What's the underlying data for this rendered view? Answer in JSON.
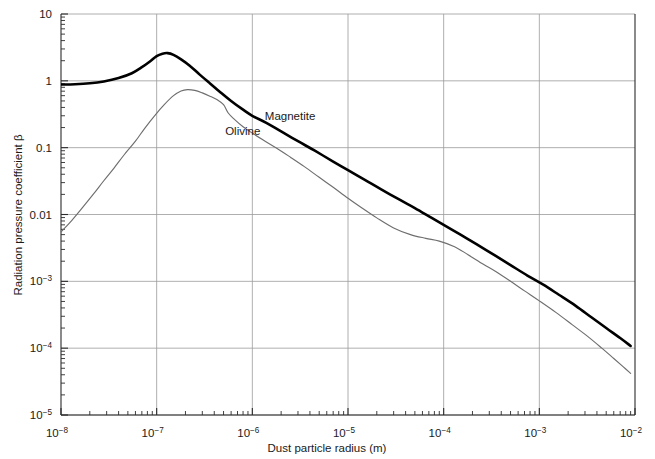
{
  "chart_data": {
    "type": "line",
    "title": "",
    "xlabel": "Dust particle radius (m)",
    "ylabel": "Radiation pressure coefficient β",
    "xscale": "log",
    "yscale": "log",
    "xlim": [
      1e-08,
      0.01
    ],
    "ylim": [
      1e-05,
      10
    ],
    "grid": true,
    "legend_position": "inline-annotation",
    "x_ticks": [
      {
        "value": 1e-08,
        "label": "10",
        "exponent": "−8"
      },
      {
        "value": 1e-07,
        "label": "10",
        "exponent": "−7"
      },
      {
        "value": 1e-06,
        "label": "10",
        "exponent": "−6"
      },
      {
        "value": 1e-05,
        "label": "10",
        "exponent": "−5"
      },
      {
        "value": 0.0001,
        "label": "10",
        "exponent": "−4"
      },
      {
        "value": 0.001,
        "label": "10",
        "exponent": "−3"
      },
      {
        "value": 0.01,
        "label": "10",
        "exponent": "−2"
      }
    ],
    "y_ticks": [
      {
        "value": 10,
        "label": "10",
        "exponent": ""
      },
      {
        "value": 1,
        "label": "1",
        "exponent": ""
      },
      {
        "value": 0.1,
        "label": "0.1",
        "exponent": ""
      },
      {
        "value": 0.01,
        "label": "0.01",
        "exponent": ""
      },
      {
        "value": 0.001,
        "label": "10",
        "exponent": "−3"
      },
      {
        "value": 0.0001,
        "label": "10",
        "exponent": "−4"
      },
      {
        "value": 1e-05,
        "label": "10",
        "exponent": "−5"
      }
    ],
    "annotations": [
      {
        "text": "Magnetite",
        "x": 1.35e-06,
        "y": 0.26
      },
      {
        "text": "Olivine",
        "x": 5.2e-07,
        "y": 0.155
      }
    ],
    "series": [
      {
        "name": "Magnetite",
        "color": "#000000",
        "linewidth": 2.6,
        "points": [
          [
            1e-08,
            0.88
          ],
          [
            1.4e-08,
            0.89
          ],
          [
            2e-08,
            0.92
          ],
          [
            2.8e-08,
            0.98
          ],
          [
            4e-08,
            1.1
          ],
          [
            5.5e-08,
            1.3
          ],
          [
            7e-08,
            1.6
          ],
          [
            8.5e-08,
            1.95
          ],
          [
            1e-07,
            2.35
          ],
          [
            1.15e-07,
            2.55
          ],
          [
            1.3e-07,
            2.6
          ],
          [
            1.5e-07,
            2.45
          ],
          [
            1.8e-07,
            2.1
          ],
          [
            2.2e-07,
            1.7
          ],
          [
            2.8e-07,
            1.25
          ],
          [
            3.5e-07,
            0.95
          ],
          [
            4.5e-07,
            0.7
          ],
          [
            6e-07,
            0.5
          ],
          [
            8e-07,
            0.37
          ],
          [
            1e-06,
            0.3
          ],
          [
            1.4e-06,
            0.235
          ],
          [
            2e-06,
            0.175
          ],
          [
            3e-06,
            0.125
          ],
          [
            4.5e-06,
            0.09
          ],
          [
            7e-06,
            0.062
          ],
          [
            1e-05,
            0.046
          ],
          [
            1.5e-05,
            0.033
          ],
          [
            2.2e-05,
            0.024
          ],
          [
            3.5e-05,
            0.0165
          ],
          [
            5e-05,
            0.0125
          ],
          [
            7.5e-05,
            0.0089
          ],
          [
            0.0001,
            0.007
          ],
          [
            0.00015,
            0.005
          ],
          [
            0.00022,
            0.0036
          ],
          [
            0.00035,
            0.0024
          ],
          [
            0.0005,
            0.00175
          ],
          [
            0.00075,
            0.00122
          ],
          [
            0.0011,
            0.00089
          ],
          [
            0.0016,
            0.00063
          ],
          [
            0.0024,
            0.00043
          ],
          [
            0.0035,
            0.00029
          ],
          [
            0.005,
            0.0002
          ],
          [
            0.007,
            0.000142
          ],
          [
            0.009,
            0.000108
          ]
        ]
      },
      {
        "name": "Olivine",
        "color": "#6e6e6e",
        "linewidth": 1.15,
        "points": [
          [
            1e-08,
            0.0055
          ],
          [
            1.3e-08,
            0.0082
          ],
          [
            1.7e-08,
            0.013
          ],
          [
            2.2e-08,
            0.0205
          ],
          [
            2.8e-08,
            0.032
          ],
          [
            3.6e-08,
            0.05
          ],
          [
            4.6e-08,
            0.079
          ],
          [
            6e-08,
            0.125
          ],
          [
            7.5e-08,
            0.195
          ],
          [
            9.5e-08,
            0.3
          ],
          [
            1.2e-07,
            0.44
          ],
          [
            1.5e-07,
            0.6
          ],
          [
            1.8e-07,
            0.705
          ],
          [
            2.1e-07,
            0.74
          ],
          [
            2.5e-07,
            0.72
          ],
          [
            3e-07,
            0.66
          ],
          [
            3.6e-07,
            0.59
          ],
          [
            4.3e-07,
            0.52
          ],
          [
            5e-07,
            0.44
          ],
          [
            5.6e-07,
            0.33
          ],
          [
            6.5e-07,
            0.265
          ],
          [
            8e-07,
            0.205
          ],
          [
            1e-06,
            0.165
          ],
          [
            1.3e-06,
            0.13
          ],
          [
            1.8e-06,
            0.098
          ],
          [
            2.5e-06,
            0.072
          ],
          [
            3.5e-06,
            0.052
          ],
          [
            5e-06,
            0.036
          ],
          [
            7e-06,
            0.0255
          ],
          [
            1e-05,
            0.0175
          ],
          [
            1.4e-05,
            0.0125
          ],
          [
            2e-05,
            0.0089
          ],
          [
            3e-05,
            0.0063
          ],
          [
            4.5e-05,
            0.005
          ],
          [
            6.5e-05,
            0.0044
          ],
          [
            9e-05,
            0.004
          ],
          [
            0.00013,
            0.0033
          ],
          [
            0.00018,
            0.0025
          ],
          [
            0.00026,
            0.0018
          ],
          [
            0.00035,
            0.0014
          ],
          [
            0.0005,
            0.001
          ],
          [
            0.0007,
            0.00072
          ],
          [
            0.001,
            0.00051
          ],
          [
            0.0015,
            0.00034
          ],
          [
            0.0022,
            0.000225
          ],
          [
            0.0032,
            0.00015
          ],
          [
            0.0045,
            0.0001
          ],
          [
            0.006,
            7e-05
          ],
          [
            0.0075,
            5.3e-05
          ],
          [
            0.009,
            4.2e-05
          ]
        ]
      }
    ]
  }
}
